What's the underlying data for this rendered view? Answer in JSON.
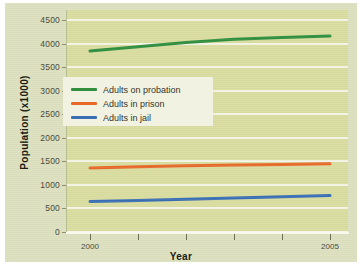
{
  "chart_data": {
    "type": "line",
    "title": "",
    "xlabel": "Year",
    "ylabel": "Population (x1000)",
    "xlim": [
      2000,
      2005
    ],
    "ylim": [
      0,
      4500
    ],
    "grid": true,
    "legend_position": "center-left",
    "x": [
      2000,
      2001,
      2002,
      2003,
      2004,
      2005
    ],
    "xtick_labels": [
      "2000",
      "",
      "",
      "",
      "",
      "2005"
    ],
    "ytick_labels": [
      "0",
      "500",
      "1000",
      "1500",
      "2000",
      "2500",
      "3000",
      "3500",
      "4000",
      "4500"
    ],
    "ytick_values": [
      0,
      500,
      1000,
      1500,
      2000,
      2500,
      3000,
      3500,
      4000,
      4500
    ],
    "series": [
      {
        "name": "Adults on probation",
        "color": "#2f8f3f",
        "values": [
          3840,
          3930,
          4020,
          4090,
          4130,
          4160
        ]
      },
      {
        "name": "Adults in prison",
        "color": "#e8692a",
        "values": [
          1360,
          1385,
          1405,
          1420,
          1435,
          1450
        ]
      },
      {
        "name": "Adults in jail",
        "color": "#3a6fb5",
        "values": [
          650,
          670,
          695,
          720,
          750,
          775
        ]
      }
    ]
  },
  "legend": {
    "entries": [
      {
        "label": "Adults on probation",
        "color": "#2f8f3f"
      },
      {
        "label": "Adults in prison",
        "color": "#e8692a"
      },
      {
        "label": "Adults in jail",
        "color": "#3a6fb5"
      }
    ]
  },
  "colors": {
    "panel_background": "#dde0bd",
    "plot_background": "#dadda0",
    "gridline": "#f4f5e6",
    "legend_background": "#f1f2e2",
    "axis_text": "#4a4a3c",
    "title_text": "#1c1c14"
  }
}
